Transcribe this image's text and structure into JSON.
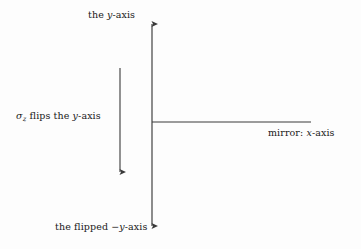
{
  "figure": {
    "background_color": "#fdfdfd",
    "stroke_color": "#3a3a3a",
    "text_color": "#1a1a1a",
    "labels": {
      "y_axis_top": {
        "prefix": "the ",
        "variable": "y",
        "suffix": "-axis"
      },
      "sigma_flips_y_axis": {
        "operator": "σ",
        "operator_subscript": "z",
        "text": " flips the ",
        "variable": "y",
        "suffix": "-axis"
      },
      "mirror_x_axis": {
        "prefix": "mirror: ",
        "variable": "x",
        "suffix": "-axis"
      },
      "flipped_y_axis_bottom": {
        "prefix": "the flipped ",
        "sign": "−",
        "variable": "y",
        "suffix": "-axis"
      }
    },
    "geometry": {
      "vertical_axis": {
        "x": 152,
        "y_top": 18,
        "y_bottom": 232,
        "arrow_top": true,
        "arrow_bottom": true
      },
      "horizontal_mirror_line": {
        "y": 122,
        "x_start": 152,
        "x_end": 311,
        "arrow_end": false
      },
      "flip_arrow": {
        "x": 120,
        "y_start": 68,
        "y_end": 178,
        "direction": "down"
      }
    }
  }
}
